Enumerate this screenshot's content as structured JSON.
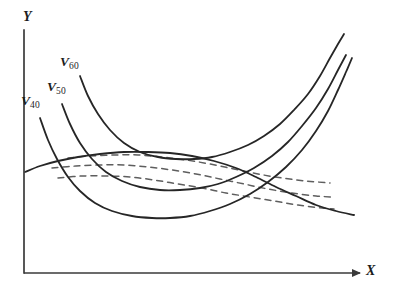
{
  "figure": {
    "background_color": "#ffffff",
    "axis_color": "#3a3a3a",
    "solid_curve_color": "#262626",
    "dashed_curve_color": "#5e5e5e"
  },
  "axes": {
    "y_label": "Y",
    "x_label": "X",
    "origin": {
      "x": 24,
      "y": 273
    },
    "y_top": {
      "x": 24,
      "y": 30
    },
    "x_right": {
      "x": 360,
      "y": 273
    },
    "arrow_on_x": true,
    "arrow_on_y": false,
    "ticks": [],
    "tick_labels": [],
    "gridlines": false
  },
  "curve_labels": [
    {
      "id": "v40",
      "base": "V",
      "subscript": "40"
    },
    {
      "id": "v50",
      "base": "V",
      "subscript": "50"
    },
    {
      "id": "v60",
      "base": "V",
      "subscript": "60"
    }
  ],
  "chart_data": {
    "type": "line",
    "title": "",
    "xlabel": "X",
    "ylabel": "Y",
    "xlim": [
      24,
      360
    ],
    "ylim": [
      30,
      273
    ],
    "grid": false,
    "legend": "inline-curve-labels",
    "note": "Pixel coordinates; y increases downward in screen space.",
    "series": [
      {
        "name": "V40",
        "style": "solid",
        "color": "#262626",
        "label": "V_40",
        "label_pos": {
          "x": 21,
          "y": 94
        },
        "points": [
          [
            40,
            118
          ],
          [
            48,
            140
          ],
          [
            57,
            159
          ],
          [
            68,
            177
          ],
          [
            80,
            191
          ],
          [
            95,
            203
          ],
          [
            112,
            211
          ],
          [
            132,
            216
          ],
          [
            152,
            218
          ],
          [
            170,
            218
          ],
          [
            190,
            216
          ],
          [
            210,
            211
          ],
          [
            230,
            204
          ],
          [
            250,
            194
          ],
          [
            268,
            182
          ],
          [
            286,
            167
          ],
          [
            302,
            150
          ],
          [
            316,
            131
          ],
          [
            328,
            111
          ],
          [
            338,
            90
          ],
          [
            346,
            72
          ],
          [
            352,
            58
          ]
        ]
      },
      {
        "name": "V50",
        "style": "solid",
        "color": "#262626",
        "label": "V_50",
        "label_pos": {
          "x": 47,
          "y": 80
        },
        "points": [
          [
            62,
            104
          ],
          [
            70,
            124
          ],
          [
            80,
            143
          ],
          [
            92,
            159
          ],
          [
            106,
            172
          ],
          [
            122,
            181
          ],
          [
            140,
            187
          ],
          [
            160,
            190
          ],
          [
            180,
            190
          ],
          [
            200,
            188
          ],
          [
            218,
            184
          ],
          [
            236,
            177
          ],
          [
            254,
            168
          ],
          [
            272,
            156
          ],
          [
            288,
            142
          ],
          [
            302,
            126
          ],
          [
            316,
            108
          ],
          [
            328,
            89
          ],
          [
            338,
            70
          ],
          [
            346,
            55
          ]
        ]
      },
      {
        "name": "V60",
        "style": "solid",
        "color": "#262626",
        "label": "V_60",
        "label_pos": {
          "x": 60,
          "y": 55
        },
        "points": [
          [
            80,
            76
          ],
          [
            88,
            96
          ],
          [
            98,
            114
          ],
          [
            110,
            130
          ],
          [
            124,
            143
          ],
          [
            140,
            152
          ],
          [
            158,
            157
          ],
          [
            176,
            159
          ],
          [
            194,
            159
          ],
          [
            212,
            157
          ],
          [
            230,
            152
          ],
          [
            248,
            145
          ],
          [
            264,
            136
          ],
          [
            280,
            124
          ],
          [
            294,
            110
          ],
          [
            308,
            94
          ],
          [
            320,
            76
          ],
          [
            330,
            58
          ],
          [
            338,
            44
          ],
          [
            344,
            34
          ]
        ]
      },
      {
        "name": "envelope-solid",
        "style": "solid",
        "color": "#262626",
        "points": [
          [
            25,
            172
          ],
          [
            40,
            166
          ],
          [
            58,
            161
          ],
          [
            78,
            157
          ],
          [
            100,
            154
          ],
          [
            124,
            152
          ],
          [
            148,
            152
          ],
          [
            170,
            153
          ],
          [
            192,
            156
          ],
          [
            214,
            161
          ],
          [
            236,
            168
          ],
          [
            256,
            177
          ],
          [
            276,
            187
          ],
          [
            296,
            196
          ],
          [
            316,
            205
          ],
          [
            336,
            211
          ],
          [
            354,
            215
          ]
        ]
      },
      {
        "name": "dashed-upper",
        "style": "dashed",
        "color": "#5e5e5e",
        "points": [
          [
            68,
            158
          ],
          [
            90,
            156
          ],
          [
            114,
            155
          ],
          [
            138,
            155
          ],
          [
            162,
            157
          ],
          [
            186,
            160
          ],
          [
            210,
            164
          ],
          [
            234,
            169
          ],
          [
            258,
            174
          ],
          [
            282,
            178
          ],
          [
            306,
            181
          ],
          [
            330,
            183
          ]
        ]
      },
      {
        "name": "dashed-middle",
        "style": "dashed",
        "color": "#5e5e5e",
        "points": [
          [
            52,
            168
          ],
          [
            76,
            166
          ],
          [
            100,
            165
          ],
          [
            124,
            165
          ],
          [
            148,
            167
          ],
          [
            172,
            170
          ],
          [
            196,
            174
          ],
          [
            220,
            179
          ],
          [
            244,
            184
          ],
          [
            268,
            189
          ],
          [
            292,
            193
          ],
          [
            316,
            196
          ],
          [
            332,
            197
          ]
        ]
      },
      {
        "name": "dashed-lower",
        "style": "dashed",
        "color": "#5e5e5e",
        "points": [
          [
            58,
            178
          ],
          [
            82,
            176
          ],
          [
            106,
            176
          ],
          [
            130,
            177
          ],
          [
            154,
            180
          ],
          [
            178,
            184
          ],
          [
            202,
            188
          ],
          [
            226,
            193
          ],
          [
            250,
            197
          ],
          [
            274,
            201
          ],
          [
            298,
            205
          ],
          [
            322,
            208
          ],
          [
            334,
            209
          ]
        ]
      }
    ]
  }
}
